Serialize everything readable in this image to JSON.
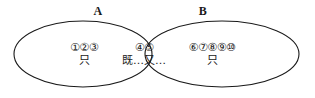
{
  "diagram": {
    "title_labels": {
      "set_a": "A",
      "set_b": "B"
    },
    "stroke_color": "#1a1a1a",
    "background_color": "#ffffff",
    "regions": {
      "left_only": {
        "numbers": "①②③",
        "phrase": "只"
      },
      "intersection": {
        "numbers": "④⑤",
        "phrase": "既…又…"
      },
      "right_only": {
        "numbers": "⑥⑦⑧⑨⑩",
        "phrase": "只"
      }
    }
  }
}
